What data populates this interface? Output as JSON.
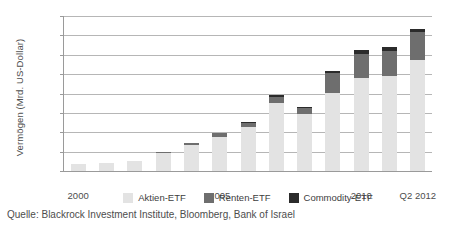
{
  "chart_data": {
    "type": "bar",
    "subtype": "stacked-vertical",
    "title": "",
    "xlabel": "",
    "ylabel": "Vermögen (Mrd. US-Dollar)",
    "ylim": [
      0,
      1600
    ],
    "ytick_values": [
      0,
      200,
      400,
      600,
      800,
      1000,
      1200,
      1400,
      1600
    ],
    "ytick_labels": [
      "0",
      "200",
      "400",
      "600",
      "800",
      "1.000",
      "1.200",
      "1.400",
      "1.600"
    ],
    "grid": "horizontal",
    "legend_position": "bottom-center",
    "categories": [
      "2000",
      "2001",
      "2002",
      "2003",
      "2004",
      "2005",
      "2006",
      "2007",
      "2008",
      "2009",
      "2010",
      "2011",
      "Q2 2012"
    ],
    "xtick_labels": [
      "2000",
      "2005",
      "2010",
      "Q2 2012"
    ],
    "xtick_categories": [
      "2000",
      "2005",
      "2010",
      "Q2 2012"
    ],
    "series": [
      {
        "name": "Aktien-ETF",
        "color": "#e3e3e3",
        "values": [
          75,
          85,
          105,
          185,
          265,
          350,
          450,
          700,
          590,
          810,
          960,
          980,
          1150
        ]
      },
      {
        "name": "Renten-ETF",
        "color": "#6e6e6e",
        "values": [
          0,
          0,
          0,
          10,
          25,
          45,
          50,
          65,
          60,
          200,
          250,
          260,
          280
        ]
      },
      {
        "name": "Commodity-ETF",
        "color": "#2b2b2b",
        "values": [
          0,
          0,
          0,
          0,
          0,
          0,
          10,
          15,
          10,
          20,
          40,
          40,
          40
        ]
      }
    ],
    "totals": [
      75,
      85,
      105,
      195,
      290,
      395,
      510,
      780,
      660,
      1030,
      1250,
      1280,
      1470
    ],
    "source": "Quelle: Blackrock Investment Institute, Bloomberg, Bank of Israel"
  },
  "legend": {
    "items": [
      {
        "label": "Aktien-ETF",
        "color": "#e3e3e3"
      },
      {
        "label": "Renten-ETF",
        "color": "#6e6e6e"
      },
      {
        "label": "Commodity-ETF",
        "color": "#2b2b2b"
      }
    ]
  },
  "source_note": "Quelle: Blackrock Investment Institute, Bloomberg, Bank of Israel"
}
